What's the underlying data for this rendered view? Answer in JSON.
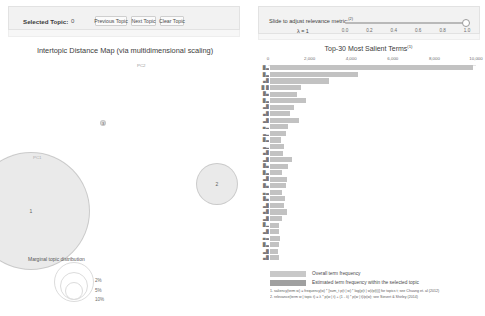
{
  "left_panel": {
    "controls": {
      "selected_topic_label": "Selected Topic:",
      "selected_topic_value": "0",
      "previous_topic_label": "Previous Topic",
      "next_topic_label": "Next Topic",
      "clear_topic_label": "Clear Topic"
    },
    "map_title": "Intertopic Distance Map (via multidimensional scaling)",
    "axis_pc2": "PC2",
    "axis_pc1": "PC1",
    "topics": [
      {
        "id": "1",
        "label": "1"
      },
      {
        "id": "2",
        "label": "2"
      },
      {
        "id": "3",
        "label": "3"
      }
    ],
    "marginal_distribution": {
      "title": "Marginal topic distribution",
      "ticks": [
        "2%",
        "5%",
        "10%"
      ]
    }
  },
  "right_panel": {
    "slider": {
      "caption": "Slide to adjust relevance metric:",
      "caption_superscript": "(2)",
      "lambda_label": "λ = 1",
      "value": 1.0,
      "ticks": [
        "0.0",
        "0.2",
        "0.4",
        "0.6",
        "0.8",
        "1.0"
      ]
    },
    "chart_title": "Top-30 Most Salient Terms",
    "chart_title_superscript": "(1)",
    "legend": [
      {
        "key": "overall",
        "label": "Overall term frequency",
        "color": "#c8c8c8"
      },
      {
        "key": "selected",
        "label": "Estimated term frequency within the selected topic",
        "color": "#a0a0a0"
      }
    ],
    "footnotes": [
      "1. saliency(term w) = frequency(w) * [sum_t p(t | w) * log(p(t | w)/p(t))] for topics t; see Chuang et. al (2012)",
      "2. relevance(term w | topic t) = λ * p(w | t) + (1 - λ) * p(w | t)/p(w); see Sievert & Shirley (2014)"
    ]
  },
  "chart_data": {
    "type": "bar",
    "title": "Top-30 Most Salient Terms",
    "xlabel": "",
    "ylabel": "",
    "xlim": [
      0,
      10000
    ],
    "orientation": "horizontal",
    "grid": false,
    "legend_position": "bottom",
    "xticks": [
      0,
      2000,
      4000,
      6000,
      8000,
      10000
    ],
    "xtick_labels": [
      "0",
      "2,000",
      "4,000",
      "6,000",
      "8,000",
      "10,000"
    ],
    "categories": [
      "█▃",
      "█▃",
      "▄█",
      "█ █",
      "█▄",
      "█▃",
      "▃█",
      "▄█",
      "▃█",
      "▄▂",
      "▃▂",
      "█▃",
      "▃▂",
      "▄█",
      "▃█",
      "█▄",
      "█▃",
      "▃█",
      "█▄",
      "▄▃",
      "█▄",
      "▃█",
      "▄█",
      "▃█",
      "█▂",
      "▃█",
      "▄▃",
      "█▃",
      "▃█",
      "▄█"
    ],
    "series": [
      {
        "name": "Overall term frequency",
        "values": [
          9850,
          4250,
          2850,
          1500,
          1320,
          1740,
          1180,
          980,
          1420,
          870,
          760,
          520,
          700,
          640,
          1060,
          880,
          600,
          810,
          790,
          560,
          730,
          700,
          820,
          560,
          420,
          430,
          470,
          440,
          400,
          420
        ]
      },
      {
        "name": "Estimated term frequency within the selected topic",
        "values": [
          0,
          0,
          0,
          0,
          0,
          0,
          0,
          0,
          0,
          0,
          0,
          0,
          0,
          0,
          0,
          0,
          0,
          0,
          0,
          0,
          0,
          0,
          0,
          0,
          0,
          0,
          0,
          0,
          0,
          0
        ]
      }
    ]
  }
}
